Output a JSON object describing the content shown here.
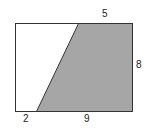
{
  "diagram": {
    "type": "rectangle-with-shaded-trapezoid",
    "labels": {
      "top": "5",
      "right": "8",
      "bottom_left": "2",
      "bottom_right": "9"
    },
    "colors": {
      "shade": "#a6a6a6",
      "stroke": "#333333",
      "background": "#ffffff"
    }
  }
}
